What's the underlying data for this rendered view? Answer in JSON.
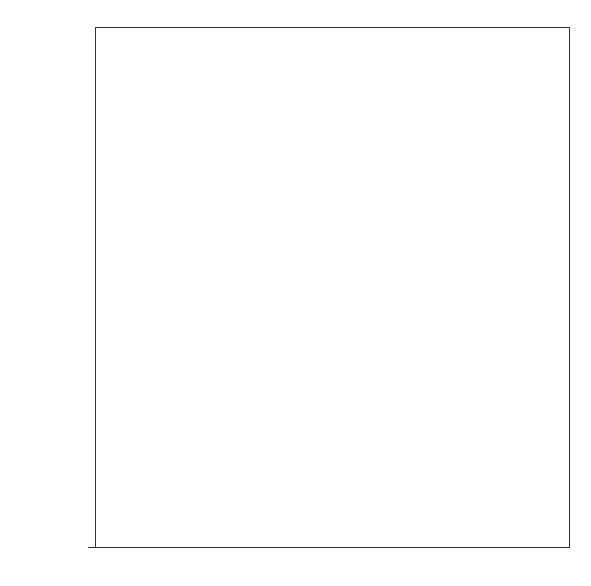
{
  "chart_data": {
    "type": "bar",
    "title": "",
    "xlabel": "",
    "ylabel": "",
    "ylim": [
      0,
      50000
    ],
    "yticks": [
      0,
      10000,
      20000,
      30000,
      40000,
      50000
    ],
    "ytick_labels": [
      "0",
      "10000",
      "20000",
      "30000",
      "40000",
      "50000"
    ],
    "categories": [
      "Sezze",
      "Lanuvium",
      "Segni"
    ],
    "values": [
      33886,
      20809,
      10132
    ],
    "data_labels": [
      "Tn 33886",
      "Tn 20809",
      "Tn 10132"
    ],
    "grid": false,
    "legend": null,
    "bar_color": "#d6d6d6"
  }
}
